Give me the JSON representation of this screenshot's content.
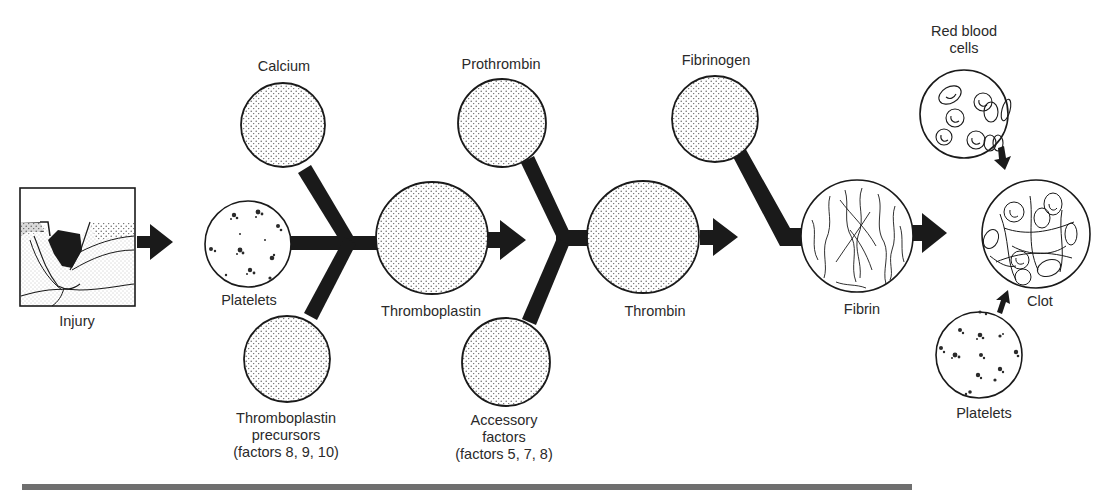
{
  "colors": {
    "ink": "#1a1a1a",
    "stipple": "#5a5a5a",
    "background": "#ffffff",
    "rule": "#6f6f6f"
  },
  "nodes": {
    "injury": {
      "label": "Injury",
      "depiction": "wound-cross-section"
    },
    "calcium": {
      "label": "Calcium",
      "depiction": "stippled-circle"
    },
    "platelets_input": {
      "label": "Platelets",
      "depiction": "platelet-clusters-circle"
    },
    "thromboplastin_precursors": {
      "label_lines": [
        "Thromboplastin",
        "precursors",
        "(factors 8, 9, 10)"
      ],
      "depiction": "stippled-circle"
    },
    "thromboplastin": {
      "label": "Thromboplastin",
      "depiction": "stippled-circle"
    },
    "prothrombin": {
      "label": "Prothrombin",
      "depiction": "stippled-circle"
    },
    "accessory_factors": {
      "label_lines": [
        "Accessory",
        "factors",
        "(factors 5, 7, 8)"
      ],
      "depiction": "stippled-circle"
    },
    "thrombin": {
      "label": "Thrombin",
      "depiction": "stippled-circle"
    },
    "fibrinogen": {
      "label": "Fibrinogen",
      "depiction": "stippled-circle"
    },
    "fibrin": {
      "label": "Fibrin",
      "depiction": "fibrous-strands-circle"
    },
    "red_blood_cells": {
      "label_lines": [
        "Red blood",
        "cells"
      ],
      "depiction": "red-cells-circle"
    },
    "clot": {
      "label": "Clot",
      "depiction": "mesh-with-cells-circle"
    },
    "platelets_clot": {
      "label": "Platelets",
      "depiction": "platelet-clusters-circle"
    }
  },
  "edges": [
    {
      "from": "injury",
      "to": "platelets_input",
      "style": "thick-arrow"
    },
    {
      "from": "calcium",
      "to": "thromboplastin",
      "style": "junction"
    },
    {
      "from": "platelets_input",
      "to": "thromboplastin",
      "style": "junction"
    },
    {
      "from": "thromboplastin_precursors",
      "to": "thromboplastin",
      "style": "junction"
    },
    {
      "from": "thromboplastin",
      "to": "thrombin",
      "style": "thick-arrow"
    },
    {
      "from": "prothrombin",
      "to": "thrombin",
      "style": "junction"
    },
    {
      "from": "accessory_factors",
      "to": "thrombin",
      "style": "junction"
    },
    {
      "from": "thrombin",
      "to": "fibrin",
      "style": "thick-arrow"
    },
    {
      "from": "fibrinogen",
      "to": "fibrin",
      "style": "junction"
    },
    {
      "from": "fibrin",
      "to": "clot",
      "style": "thick-arrow"
    },
    {
      "from": "red_blood_cells",
      "to": "clot",
      "style": "small-arrow"
    },
    {
      "from": "platelets_clot",
      "to": "clot",
      "style": "small-arrow"
    }
  ]
}
